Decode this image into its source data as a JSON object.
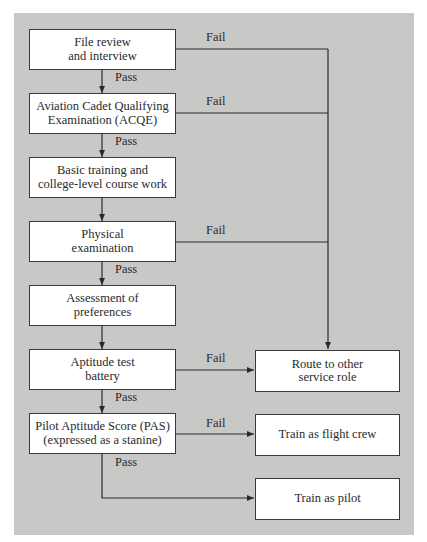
{
  "diagram": {
    "type": "flowchart",
    "background_color": "#c8c8c6",
    "box_color": "#ffffff",
    "line_color": "#2a2a2a",
    "steps": [
      {
        "id": "file_review",
        "label": "File review\nand interview"
      },
      {
        "id": "acqe",
        "label": "Aviation Cadet Qualifying\nExamination (ACQE)"
      },
      {
        "id": "basic_training",
        "label": "Basic training and\ncollege-level course work"
      },
      {
        "id": "physical",
        "label": "Physical\nexamination"
      },
      {
        "id": "preferences",
        "label": "Assessment of\npreferences"
      },
      {
        "id": "aptitude",
        "label": "Aptitude test\nbattery"
      },
      {
        "id": "pas",
        "label": "Pilot Aptitude Score (PAS)\n(expressed as a stanine)"
      }
    ],
    "outcomes": [
      {
        "id": "route_other",
        "label": "Route to other\nservice role"
      },
      {
        "id": "flight_crew",
        "label": "Train as flight crew"
      },
      {
        "id": "pilot",
        "label": "Train as pilot"
      }
    ],
    "edge_labels": {
      "pass": "Pass",
      "fail": "Fail"
    },
    "edges": [
      {
        "from": "file_review",
        "to": "acqe",
        "label": "Pass"
      },
      {
        "from": "file_review",
        "to": "route_other",
        "label": "Fail"
      },
      {
        "from": "acqe",
        "to": "basic_training",
        "label": "Pass"
      },
      {
        "from": "acqe",
        "to": "route_other",
        "label": "Fail"
      },
      {
        "from": "basic_training",
        "to": "physical",
        "label": ""
      },
      {
        "from": "physical",
        "to": "preferences",
        "label": "Pass"
      },
      {
        "from": "physical",
        "to": "route_other",
        "label": "Fail"
      },
      {
        "from": "preferences",
        "to": "aptitude",
        "label": ""
      },
      {
        "from": "aptitude",
        "to": "pas",
        "label": "Pass"
      },
      {
        "from": "aptitude",
        "to": "route_other",
        "label": "Fail"
      },
      {
        "from": "pas",
        "to": "flight_crew",
        "label": "Fail"
      },
      {
        "from": "pas",
        "to": "pilot",
        "label": "Pass"
      }
    ]
  }
}
